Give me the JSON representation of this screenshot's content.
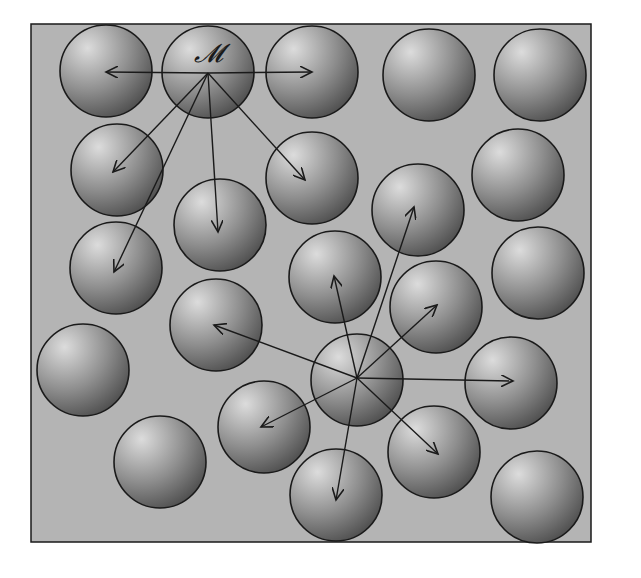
{
  "figure": {
    "frame": {
      "x": 31,
      "y": 24,
      "w": 560,
      "h": 518
    },
    "colors": {
      "background": "#b4b4b4",
      "sphere_light": "#d8d8d8",
      "sphere_dark": "#5a5a5a",
      "stroke": "#1a1a1a"
    },
    "radius": 46,
    "center_label": "𝓜",
    "spheres": [
      {
        "x": 106,
        "y": 71
      },
      {
        "x": 208,
        "y": 72
      },
      {
        "x": 312,
        "y": 72
      },
      {
        "x": 429,
        "y": 75
      },
      {
        "x": 540,
        "y": 75
      },
      {
        "x": 117,
        "y": 170
      },
      {
        "x": 312,
        "y": 178
      },
      {
        "x": 518,
        "y": 175
      },
      {
        "x": 220,
        "y": 225
      },
      {
        "x": 418,
        "y": 210
      },
      {
        "x": 116,
        "y": 268
      },
      {
        "x": 335,
        "y": 277
      },
      {
        "x": 538,
        "y": 273
      },
      {
        "x": 216,
        "y": 325
      },
      {
        "x": 436,
        "y": 307
      },
      {
        "x": 83,
        "y": 370
      },
      {
        "x": 357,
        "y": 380
      },
      {
        "x": 511,
        "y": 383
      },
      {
        "x": 264,
        "y": 427
      },
      {
        "x": 434,
        "y": 452
      },
      {
        "x": 160,
        "y": 462
      },
      {
        "x": 336,
        "y": 495
      },
      {
        "x": 537,
        "y": 497
      }
    ],
    "arrow_groups": [
      {
        "origin": {
          "x": 208,
          "y": 73
        },
        "targets": [
          {
            "x": 106,
            "y": 72
          },
          {
            "x": 312,
            "y": 72
          },
          {
            "x": 113,
            "y": 172
          },
          {
            "x": 114,
            "y": 272
          },
          {
            "x": 218,
            "y": 232
          },
          {
            "x": 305,
            "y": 180
          }
        ]
      },
      {
        "origin": {
          "x": 357,
          "y": 378
        },
        "targets": [
          {
            "x": 214,
            "y": 325
          },
          {
            "x": 334,
            "y": 276
          },
          {
            "x": 414,
            "y": 207
          },
          {
            "x": 437,
            "y": 305
          },
          {
            "x": 513,
            "y": 381
          },
          {
            "x": 438,
            "y": 454
          },
          {
            "x": 336,
            "y": 500
          },
          {
            "x": 261,
            "y": 427
          }
        ]
      }
    ]
  }
}
